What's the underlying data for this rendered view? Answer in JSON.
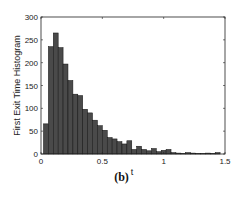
{
  "figure": {
    "caption": "(b)"
  },
  "chart_data": {
    "type": "bar",
    "title": "",
    "xlabel": "t",
    "ylabel": "First Exit Time Histogram",
    "xlim": [
      0,
      1.5
    ],
    "ylim": [
      0,
      300
    ],
    "xticks": [
      "0",
      "0.5",
      "1",
      "1.5"
    ],
    "yticks": [
      "0",
      "50",
      "100",
      "150",
      "200",
      "250",
      "300"
    ],
    "grid": false,
    "legend": null,
    "bar_width": 0.04,
    "bar_color": "#4a4a4a",
    "edge_color": "#111111",
    "x": [
      0.04,
      0.08,
      0.12,
      0.16,
      0.2,
      0.24,
      0.28,
      0.32,
      0.36,
      0.4,
      0.44,
      0.48,
      0.52,
      0.56,
      0.6,
      0.64,
      0.68,
      0.72,
      0.76,
      0.8,
      0.84,
      0.88,
      0.92,
      0.96,
      1.0,
      1.04,
      1.08,
      1.12,
      1.16,
      1.2,
      1.24,
      1.28,
      1.32,
      1.36,
      1.4,
      1.44
    ],
    "values": [
      66,
      235,
      265,
      233,
      197,
      161,
      131,
      128,
      98,
      90,
      74,
      62,
      52,
      36,
      33,
      27,
      22,
      29,
      10,
      17,
      10,
      7,
      12,
      5,
      8,
      10,
      3,
      2,
      1,
      3,
      2,
      1,
      1,
      2,
      1,
      3
    ]
  }
}
